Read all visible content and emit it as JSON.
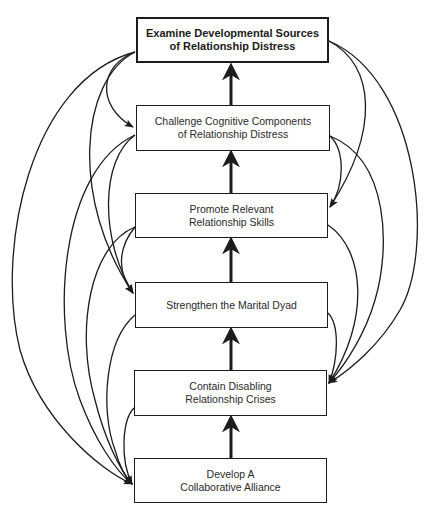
{
  "diagram": {
    "type": "hierarchical-flow",
    "colors": {
      "line": "#1c1c1c",
      "box_border": "#1c1c1c",
      "text": "#2a2a2a",
      "background": "#ffffff"
    },
    "nodes": [
      {
        "id": "n1",
        "lines": [
          "Examine Developmental Sources",
          "of Relationship Distress"
        ],
        "bold": true
      },
      {
        "id": "n2",
        "lines": [
          "Challenge Cognitive Components",
          "of Relationship Distress"
        ],
        "bold": false
      },
      {
        "id": "n3",
        "lines": [
          "Promote Relevant",
          "Relationship Skills"
        ],
        "bold": false
      },
      {
        "id": "n4",
        "lines": [
          "Strengthen the Marital Dyad"
        ],
        "bold": false
      },
      {
        "id": "n5",
        "lines": [
          "Contain Disabling",
          "Relationship Crises"
        ],
        "bold": false
      },
      {
        "id": "n6",
        "lines": [
          "Develop A",
          "Collaborative Alliance"
        ],
        "bold": false
      }
    ],
    "straight_arrows": [
      {
        "from": "n6",
        "to": "n5"
      },
      {
        "from": "n5",
        "to": "n4"
      },
      {
        "from": "n4",
        "to": "n3"
      },
      {
        "from": "n3",
        "to": "n2"
      },
      {
        "from": "n2",
        "to": "n1"
      }
    ],
    "curved_connectors_left": [
      {
        "from": "n1",
        "to": "n2"
      },
      {
        "from": "n1",
        "to": "n4"
      },
      {
        "from": "n1",
        "to": "n6"
      },
      {
        "from": "n2",
        "to": "n4"
      },
      {
        "from": "n2",
        "to": "n6"
      },
      {
        "from": "n3",
        "to": "n4"
      },
      {
        "from": "n3",
        "to": "n6"
      },
      {
        "from": "n4",
        "to": "n6"
      },
      {
        "from": "n5",
        "to": "n6"
      }
    ],
    "curved_connectors_right": [
      {
        "from": "n1",
        "to": "n3"
      },
      {
        "from": "n1",
        "to": "n5"
      },
      {
        "from": "n2",
        "to": "n3"
      },
      {
        "from": "n2",
        "to": "n5"
      },
      {
        "from": "n3",
        "to": "n5"
      },
      {
        "from": "n4",
        "to": "n5"
      }
    ]
  }
}
